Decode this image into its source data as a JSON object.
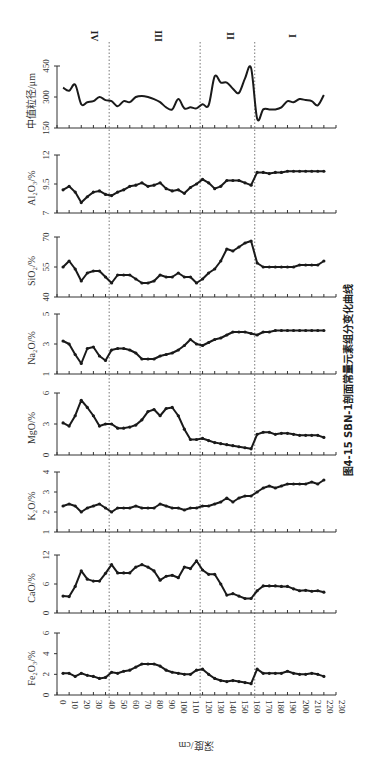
{
  "chart_data": {
    "type": "line",
    "title": "图4-15 SBN-1剖面常量元素组分变化曲线",
    "xlabel": "深度/cm",
    "xlim": [
      0,
      230
    ],
    "x_ticks": [
      0,
      10,
      20,
      30,
      40,
      50,
      60,
      70,
      80,
      90,
      100,
      110,
      120,
      130,
      140,
      150,
      160,
      170,
      180,
      190,
      200,
      210,
      220,
      230
    ],
    "zones": [
      {
        "label": "IV",
        "from": 0,
        "to": 43
      },
      {
        "label": "III",
        "from": 43,
        "to": 118
      },
      {
        "label": "II",
        "from": 118,
        "to": 163
      },
      {
        "label": "I",
        "from": 163,
        "to": 220
      }
    ],
    "zone_boundaries": [
      43,
      118,
      163
    ],
    "x": [
      5,
      10,
      15,
      20,
      25,
      30,
      35,
      40,
      45,
      50,
      55,
      60,
      65,
      70,
      75,
      80,
      85,
      90,
      95,
      100,
      105,
      110,
      115,
      120,
      125,
      130,
      135,
      140,
      145,
      150,
      155,
      160,
      165,
      170,
      175,
      180,
      185,
      190,
      195,
      200,
      205,
      210,
      215,
      220
    ],
    "series": [
      {
        "name": "中值粒径/μm",
        "key": "median_grain",
        "markers": false,
        "ylim": [
          150,
          450
        ],
        "yticks": [
          150,
          300,
          450
        ],
        "values": [
          345,
          330,
          360,
          265,
          275,
          280,
          300,
          285,
          280,
          255,
          280,
          275,
          300,
          305,
          300,
          290,
          275,
          250,
          240,
          290,
          245,
          250,
          245,
          265,
          260,
          400,
          370,
          370,
          340,
          320,
          390,
          440,
          195,
          240,
          240,
          240,
          250,
          280,
          275,
          290,
          285,
          280,
          260,
          310
        ]
      },
      {
        "name": "Al₂O₃/%",
        "key": "al2o3",
        "markers": true,
        "ylim": [
          7,
          12
        ],
        "yticks": [
          7,
          9.5,
          12
        ],
        "values": [
          9.0,
          9.3,
          8.8,
          7.9,
          8.4,
          8.8,
          8.9,
          8.6,
          8.5,
          8.8,
          9.0,
          9.3,
          9.4,
          9.6,
          9.3,
          9.4,
          9.6,
          9.1,
          8.9,
          9.0,
          8.7,
          9.2,
          9.5,
          9.9,
          9.6,
          9.1,
          9.3,
          9.8,
          9.8,
          9.8,
          9.6,
          9.4,
          10.5,
          10.5,
          10.4,
          10.5,
          10.5,
          10.6,
          10.6,
          10.6,
          10.6,
          10.6,
          10.6,
          10.6
        ]
      },
      {
        "name": "SiO₂/%",
        "key": "sio2",
        "markers": true,
        "ylim": [
          40,
          70
        ],
        "yticks": [
          40,
          55,
          70
        ],
        "values": [
          55,
          58,
          54,
          48,
          52,
          53,
          53,
          50,
          47,
          51,
          51,
          51,
          49,
          47,
          47,
          48,
          51,
          50,
          50,
          52,
          50,
          50,
          47,
          49,
          52,
          54,
          58,
          64,
          63,
          65,
          67,
          68,
          57,
          55,
          55,
          55,
          55,
          55,
          55,
          56,
          56,
          56,
          56,
          58
        ]
      },
      {
        "name": "Na₂O/%",
        "key": "na2o",
        "markers": true,
        "ylim": [
          1,
          5
        ],
        "yticks": [
          1,
          3,
          5
        ],
        "values": [
          3.2,
          3.0,
          2.3,
          1.7,
          2.7,
          2.8,
          2.2,
          1.9,
          2.6,
          2.7,
          2.7,
          2.6,
          2.4,
          2.0,
          2.0,
          2.0,
          2.2,
          2.3,
          2.4,
          2.6,
          2.9,
          3.3,
          3.0,
          2.9,
          3.1,
          3.3,
          3.4,
          3.6,
          3.8,
          3.8,
          3.8,
          3.7,
          3.6,
          3.8,
          3.8,
          3.9,
          3.9,
          3.9,
          3.9,
          3.9,
          3.9,
          3.9,
          3.9,
          3.9
        ]
      },
      {
        "name": "MgO/%",
        "key": "mgo",
        "markers": true,
        "ylim": [
          0,
          6
        ],
        "yticks": [
          0,
          3,
          6
        ],
        "values": [
          3.1,
          2.8,
          3.8,
          5.3,
          4.6,
          3.8,
          2.8,
          3.0,
          3.0,
          2.6,
          2.6,
          2.7,
          2.9,
          3.4,
          4.2,
          4.4,
          3.8,
          4.5,
          4.6,
          3.8,
          2.5,
          1.5,
          1.5,
          1.6,
          1.4,
          1.2,
          1.1,
          1.0,
          0.9,
          0.8,
          0.7,
          0.6,
          2.0,
          2.2,
          2.2,
          2.0,
          2.1,
          2.1,
          2.0,
          1.9,
          1.9,
          1.9,
          1.9,
          1.7
        ]
      },
      {
        "name": "K₂O/%",
        "key": "k2o",
        "markers": true,
        "ylim": [
          1,
          4
        ],
        "yticks": [
          1,
          2,
          3,
          4
        ],
        "values": [
          2.3,
          2.4,
          2.3,
          2.0,
          2.2,
          2.3,
          2.4,
          2.2,
          2.0,
          2.2,
          2.2,
          2.2,
          2.3,
          2.2,
          2.2,
          2.2,
          2.4,
          2.3,
          2.2,
          2.2,
          2.1,
          2.2,
          2.2,
          2.3,
          2.3,
          2.4,
          2.5,
          2.7,
          2.5,
          2.7,
          2.8,
          2.8,
          3.0,
          3.2,
          3.3,
          3.2,
          3.3,
          3.4,
          3.4,
          3.4,
          3.4,
          3.5,
          3.4,
          3.6
        ]
      },
      {
        "name": "CaO/%",
        "key": "cao",
        "markers": true,
        "ylim": [
          0,
          12
        ],
        "yticks": [
          0,
          6,
          12
        ],
        "values": [
          3.5,
          3.4,
          5.5,
          8.7,
          7.0,
          6.6,
          6.6,
          8.2,
          10.0,
          8.3,
          8.3,
          8.3,
          9.5,
          10.0,
          9.5,
          8.7,
          6.8,
          7.6,
          7.8,
          7.3,
          9.5,
          9.2,
          10.8,
          8.9,
          8.0,
          8.0,
          6.0,
          3.7,
          4.0,
          3.5,
          3.0,
          3.0,
          4.6,
          5.6,
          5.6,
          5.6,
          5.5,
          5.5,
          5.0,
          4.6,
          4.7,
          4.5,
          4.6,
          4.3
        ]
      },
      {
        "name": "Fe₂O₃/%",
        "key": "fe2o3",
        "markers": true,
        "ylim": [
          0,
          6
        ],
        "yticks": [
          0,
          2,
          4,
          6
        ],
        "values": [
          2.1,
          2.1,
          1.8,
          2.1,
          1.9,
          1.8,
          1.6,
          1.7,
          2.2,
          2.1,
          2.3,
          2.4,
          2.7,
          3.0,
          3.0,
          3.0,
          2.8,
          2.4,
          2.2,
          2.1,
          2.0,
          2.0,
          2.4,
          2.5,
          2.0,
          1.6,
          1.4,
          1.3,
          1.4,
          1.3,
          1.2,
          1.1,
          2.5,
          2.1,
          2.1,
          2.1,
          2.1,
          2.3,
          2.1,
          2.0,
          2.0,
          2.1,
          2.0,
          1.8
        ]
      }
    ]
  },
  "figure": {
    "caption": "图4-15 SBN-1剖面常量元素组分变化曲线",
    "xlabel": "深度/cm"
  }
}
